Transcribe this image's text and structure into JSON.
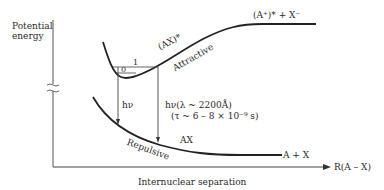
{
  "axes": {
    "y_label_line1": "Potential",
    "y_label_line2": "energy",
    "x_label": "Internuclear separation",
    "x_axis_end_label": "R(A – X)"
  },
  "curves": {
    "attractive": {
      "state_label": "(AX)*",
      "type_label": "Attractive",
      "asymptote_label": "(A⁺)* + X⁻"
    },
    "repulsive": {
      "state_label": "AX",
      "type_label": "Repulsive",
      "asymptote_label": "A + X"
    }
  },
  "levels": {
    "v1": "1",
    "v0": "0"
  },
  "transitions": {
    "left_label": "hν",
    "right_label_line1": "hν(λ ~ 2200Å)",
    "right_label_line2": "(τ ~ 6 – 8 × 10⁻⁹ s)"
  },
  "colors": {
    "line": "#222222",
    "thin_line": "#444444",
    "background": "#ffffff"
  }
}
